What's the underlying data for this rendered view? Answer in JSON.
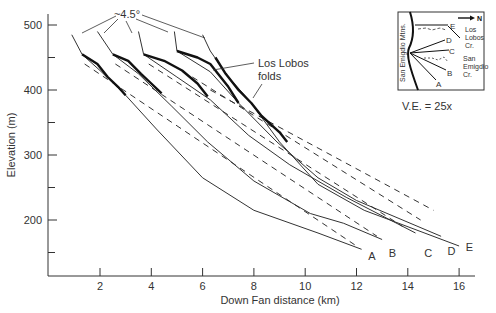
{
  "chart_data": {
    "type": "line",
    "title": "",
    "xlabel": "Down Fan distance (km)",
    "ylabel": "Elevation (m)",
    "xlim": [
      0,
      17
    ],
    "ylim": [
      120,
      520
    ],
    "x_ticks": [
      2,
      4,
      6,
      8,
      10,
      12,
      14,
      16
    ],
    "y_ticks": [
      200,
      300,
      400,
      500
    ],
    "y_minor_ticks": [
      150,
      250,
      350,
      450
    ],
    "grid": false,
    "series": [
      {
        "name": "A",
        "style": "solid",
        "points": [
          [
            1.3,
            455
          ],
          [
            2.0,
            430
          ],
          [
            3.0,
            392
          ],
          [
            4.2,
            340
          ],
          [
            6.0,
            265
          ],
          [
            8.0,
            215
          ],
          [
            10.5,
            180
          ],
          [
            12.2,
            155
          ]
        ]
      },
      {
        "name": "B",
        "style": "solid",
        "points": [
          [
            2.5,
            455
          ],
          [
            3.5,
            425
          ],
          [
            4.8,
            375
          ],
          [
            6.2,
            320
          ],
          [
            8.0,
            260
          ],
          [
            10.2,
            210
          ],
          [
            11.5,
            195
          ],
          [
            13.0,
            170
          ]
        ]
      },
      {
        "name": "C",
        "style": "solid",
        "points": [
          [
            3.7,
            455
          ],
          [
            5.0,
            420
          ],
          [
            6.3,
            385
          ],
          [
            7.8,
            330
          ],
          [
            9.4,
            285
          ],
          [
            11.6,
            235
          ],
          [
            14.3,
            180
          ]
        ]
      },
      {
        "name": "D",
        "style": "solid",
        "points": [
          [
            5.0,
            460
          ],
          [
            6.3,
            428
          ],
          [
            7.4,
            380
          ],
          [
            8.9,
            320
          ],
          [
            10.5,
            265
          ],
          [
            12.0,
            230
          ],
          [
            15.3,
            175
          ]
        ]
      },
      {
        "name": "E",
        "style": "solid",
        "points": [
          [
            6.3,
            460
          ],
          [
            7.0,
            420
          ],
          [
            7.8,
            385
          ],
          [
            9.0,
            320
          ],
          [
            10.5,
            255
          ],
          [
            12.3,
            215
          ],
          [
            16.0,
            160
          ]
        ]
      }
    ],
    "upper_segments": [
      {
        "name": "A",
        "from": [
          0.9,
          485
        ],
        "to": [
          1.3,
          455
        ]
      },
      {
        "name": "B",
        "from": [
          1.9,
          490
        ],
        "to": [
          2.5,
          455
        ]
      },
      {
        "name": "C",
        "from": [
          3.5,
          490
        ],
        "to": [
          3.7,
          455
        ]
      },
      {
        "name": "D",
        "from": [
          4.9,
          490
        ],
        "to": [
          5.0,
          460
        ]
      },
      {
        "name": "E",
        "from": [
          6.0,
          485
        ],
        "to": [
          6.3,
          460
        ]
      }
    ],
    "fold_segments": [
      {
        "name": "A",
        "points": [
          [
            1.3,
            455
          ],
          [
            1.9,
            440
          ],
          [
            2.3,
            420
          ],
          [
            2.7,
            405
          ],
          [
            3.0,
            392
          ]
        ]
      },
      {
        "name": "B",
        "points": [
          [
            2.5,
            455
          ],
          [
            3.1,
            445
          ],
          [
            3.6,
            425
          ],
          [
            4.0,
            410
          ],
          [
            4.4,
            395
          ]
        ]
      },
      {
        "name": "C",
        "points": [
          [
            3.7,
            455
          ],
          [
            4.5,
            445
          ],
          [
            5.2,
            430
          ],
          [
            5.8,
            410
          ],
          [
            6.2,
            390
          ]
        ]
      },
      {
        "name": "D",
        "points": [
          [
            5.0,
            460
          ],
          [
            5.8,
            450
          ],
          [
            6.3,
            440
          ],
          [
            6.6,
            425
          ],
          [
            7.0,
            405
          ],
          [
            7.4,
            380
          ]
        ]
      },
      {
        "name": "E",
        "points": [
          [
            6.5,
            450
          ],
          [
            6.9,
            425
          ],
          [
            7.4,
            400
          ],
          [
            7.9,
            380
          ],
          [
            8.3,
            360
          ],
          [
            9.0,
            335
          ],
          [
            9.3,
            320
          ]
        ]
      }
    ],
    "dashed_trends": [
      {
        "name": "A",
        "from": [
          1.4,
          440
        ],
        "to": [
          12.0,
          160
        ]
      },
      {
        "name": "B",
        "from": [
          2.6,
          440
        ],
        "to": [
          12.8,
          175
        ]
      },
      {
        "name": "C",
        "from": [
          3.9,
          440
        ],
        "to": [
          13.8,
          190
        ]
      },
      {
        "name": "D",
        "from": [
          5.6,
          420
        ],
        "to": [
          14.5,
          200
        ]
      },
      {
        "name": "E",
        "from": [
          6.3,
          400
        ],
        "to": [
          15.0,
          215
        ]
      }
    ],
    "annotations": [
      {
        "text": "~4.5°",
        "x": 5.1,
        "y": 502
      },
      {
        "text": "Los Lobos",
        "x": 8.9,
        "y": 425
      },
      {
        "text": "folds",
        "x": 8.9,
        "y": 410
      },
      {
        "text": "V.E. = 25x",
        "x": 15.5,
        "y": 400
      }
    ],
    "profile_labels": [
      {
        "text": "A",
        "x": 12.6,
        "y": 145
      },
      {
        "text": "B",
        "x": 13.4,
        "y": 150
      },
      {
        "text": "C",
        "x": 14.8,
        "y": 150
      },
      {
        "text": "D",
        "x": 15.7,
        "y": 152
      },
      {
        "text": "E",
        "x": 16.4,
        "y": 158
      }
    ],
    "legend": {
      "position": "inset-top-right"
    }
  },
  "inset": {
    "north_label": "N",
    "mountain_label": "San Emigdio Mtns.",
    "creek_labels": [
      "Los",
      "Lobos",
      "Cr.",
      "San",
      "Emigdio",
      "Cr."
    ],
    "profile_letters": [
      "A",
      "B",
      "C",
      "D",
      "E"
    ],
    "ve_label": "V.E. = 25x"
  },
  "labels": {
    "xlabel": "Down Fan distance (km)",
    "ylabel": "Elevation (m)",
    "angle": "~4.5°",
    "folds_line1": "Los Lobos",
    "folds_line2": "folds",
    "ve": "V.E. = 25x",
    "x_ticks": [
      "2",
      "4",
      "6",
      "8",
      "10",
      "12",
      "14",
      "16"
    ],
    "y_ticks": [
      "500",
      "400",
      "300",
      "200"
    ],
    "profiles": [
      "A",
      "B",
      "C",
      "D",
      "E"
    ]
  }
}
